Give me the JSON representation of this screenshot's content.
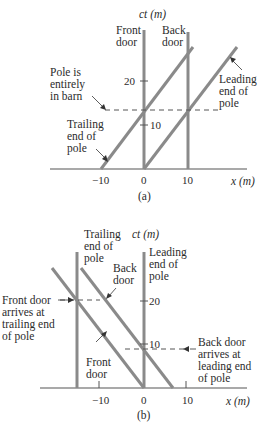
{
  "panel_a": {
    "caption": "(a)",
    "axis_y_label": "ct (m)",
    "axis_x_label": "x (m)",
    "x_ticks": [
      "−10",
      "0",
      "10"
    ],
    "y_ticks": [
      "10",
      "20"
    ],
    "labels": {
      "front_door": [
        "Front",
        "door"
      ],
      "back_door": [
        "Back",
        "door"
      ],
      "pole_in_barn": [
        "Pole is",
        "entirely",
        "in barn"
      ],
      "leading_end": [
        "Leading",
        "end of",
        "pole"
      ],
      "trailing_end": [
        "Trailing",
        "end of",
        "pole"
      ]
    }
  },
  "panel_b": {
    "caption": "(b)",
    "axis_y_label": "ct (m)",
    "axis_x_label": "x (m)",
    "x_ticks": [
      "−10",
      "0",
      "10"
    ],
    "y_ticks": [
      "10",
      "20"
    ],
    "labels": {
      "trailing_end": [
        "Trailing",
        "end of",
        "pole"
      ],
      "leading_end": [
        "Leading",
        "end of",
        "pole"
      ],
      "back_door": [
        "Back",
        "door"
      ],
      "front_door": [
        "Front",
        "door"
      ],
      "front_door_arrives": [
        "Front door",
        "arrives at",
        "trailing end",
        "of pole"
      ],
      "back_door_arrives": [
        "Back door",
        "arrives at",
        "leading end",
        "of pole"
      ]
    }
  },
  "colors": {
    "worldline": "#8a8a8a",
    "axis": "#555555",
    "text": "#2b2b2b"
  }
}
